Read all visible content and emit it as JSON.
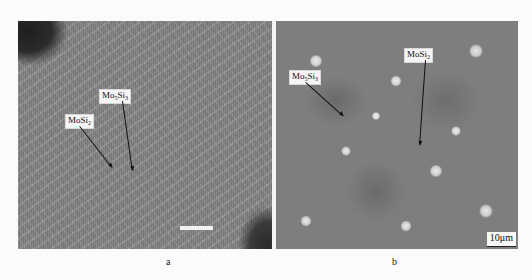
{
  "figure": {
    "panels": [
      {
        "id": "a",
        "caption": "a",
        "labels": [
          {
            "text": "MoSi",
            "sub": "2",
            "name": "label-mosi2"
          },
          {
            "text": "Mo",
            "sub1": "5",
            "text2": "Si",
            "sub2": "3",
            "name": "label-mo5si3"
          }
        ],
        "scale_bar_text": ""
      },
      {
        "id": "b",
        "caption": "b",
        "labels": [
          {
            "text": "MoSi",
            "sub": "2",
            "name": "label-mosi2"
          },
          {
            "text": "Mo",
            "sub1": "5",
            "text2": "Si",
            "sub2": "3",
            "name": "label-mo5si3"
          }
        ],
        "scale_bar_text": "10μm"
      }
    ]
  }
}
